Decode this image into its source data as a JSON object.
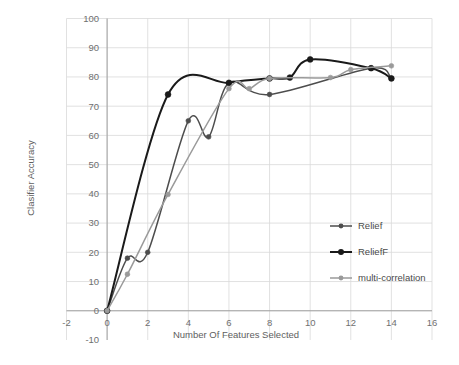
{
  "chart_data": {
    "type": "line",
    "title": "",
    "xlabel": "Number Of Features Selected",
    "ylabel": "Clasifier Accuracy",
    "xlim": [
      -2,
      16
    ],
    "ylim": [
      -10,
      100
    ],
    "xticks": [
      -2,
      0,
      2,
      4,
      6,
      8,
      10,
      12,
      14,
      16
    ],
    "yticks": [
      -10,
      0,
      10,
      20,
      30,
      40,
      50,
      60,
      70,
      80,
      90,
      100
    ],
    "grid": true,
    "legend_position": "right-middle",
    "series": [
      {
        "name": "Relief",
        "color": "#4d4d4d",
        "x": [
          0,
          1,
          2,
          4,
          5,
          6,
          8,
          13,
          14
        ],
        "y": [
          0,
          18,
          20,
          65,
          59.5,
          78,
          74,
          83,
          79.5
        ]
      },
      {
        "name": "ReliefF",
        "color": "#1a1a1a",
        "x": [
          0,
          3,
          6,
          8,
          9,
          10,
          13,
          14
        ],
        "y": [
          0,
          74,
          78,
          79.5,
          79.8,
          86,
          83,
          79.5
        ]
      },
      {
        "name": "multi-correlation",
        "color": "#9a9a9a",
        "x": [
          0,
          1,
          3,
          6,
          7,
          8,
          11,
          12,
          14
        ],
        "y": [
          0,
          12.5,
          39.8,
          76,
          76,
          79.5,
          79.8,
          82.5,
          83.8
        ]
      }
    ]
  },
  "axis": {
    "x_label": "Number Of Features Selected",
    "y_label": "Clasifier Accuracy",
    "x_tick_labels": [
      "-2",
      "0",
      "2",
      "4",
      "6",
      "8",
      "10",
      "12",
      "14",
      "16"
    ],
    "y_tick_labels": [
      "-10",
      "0",
      "10",
      "20",
      "30",
      "40",
      "50",
      "60",
      "70",
      "80",
      "90",
      "100"
    ]
  },
  "legend": {
    "items": [
      {
        "label": "Relief",
        "color": "#4d4d4d"
      },
      {
        "label": "ReliefF",
        "color": "#1a1a1a"
      },
      {
        "label": "multi-correlation",
        "color": "#9a9a9a"
      }
    ]
  },
  "colors": {
    "background": "#ffffff",
    "grid": "#d9d9d9",
    "axis": "#9a9a9a",
    "text": "#6f6f6f"
  }
}
